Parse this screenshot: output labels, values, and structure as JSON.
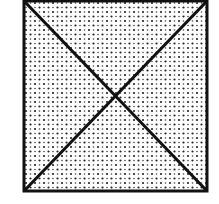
{
  "figure": {
    "shape": "square",
    "fill": "dot-stipple",
    "stroke_color": "#111111",
    "background_color": "#ffffff",
    "dot_color": "#222222",
    "has_diagonals": true,
    "square": {
      "x": 24,
      "y": 1,
      "size_w": 183,
      "size_h": 190
    }
  }
}
